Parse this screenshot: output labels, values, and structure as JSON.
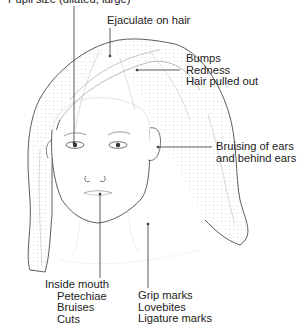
{
  "diagram": {
    "labels": {
      "pupil": "Pupil size (dilated, large)",
      "hair_top": "Ejaculate on hair",
      "scalp": [
        "Bumps",
        "Redness",
        "Hair pulled out"
      ],
      "ears": [
        "Bruising of ears",
        "and behind ears"
      ],
      "mouth": [
        "Inside mouth",
        "Petechiae",
        "Bruises",
        "Cuts"
      ],
      "neck": [
        "Grip marks",
        "Lovebites",
        "Ligature marks"
      ]
    },
    "colors": {
      "line": "#222222",
      "stipple": "#9a9a9a",
      "background": "#ffffff"
    }
  }
}
